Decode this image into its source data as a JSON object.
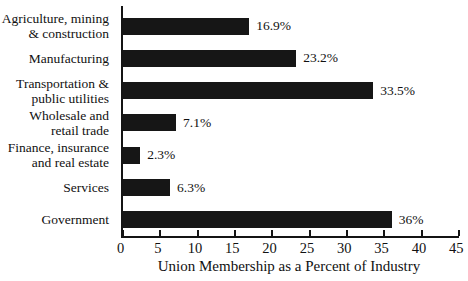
{
  "chart_data": {
    "type": "bar",
    "orientation": "horizontal",
    "title": "",
    "categories": [
      "Agriculture, mining\n& construction",
      "Manufacturing",
      "Transportation &\npublic utilities",
      "Wholesale and\nretail trade",
      "Finance, insurance\nand real estate",
      "Services",
      "Government"
    ],
    "values": [
      16.9,
      23.2,
      33.5,
      7.1,
      2.3,
      6.3,
      36
    ],
    "value_labels": [
      "16.9%",
      "23.2%",
      "33.5%",
      "7.1%",
      "2.3%",
      "6.3%",
      "36%"
    ],
    "xlabel": "Union Membership as a Percent of Industry",
    "ylabel": "",
    "xlim": [
      0,
      45
    ],
    "x_ticks": [
      0,
      5,
      10,
      15,
      20,
      25,
      30,
      35,
      40,
      45
    ],
    "grid": "off",
    "legend": "none",
    "bar_color": "#161616",
    "axis_color": "#141414",
    "background_color": "#ffffff"
  }
}
